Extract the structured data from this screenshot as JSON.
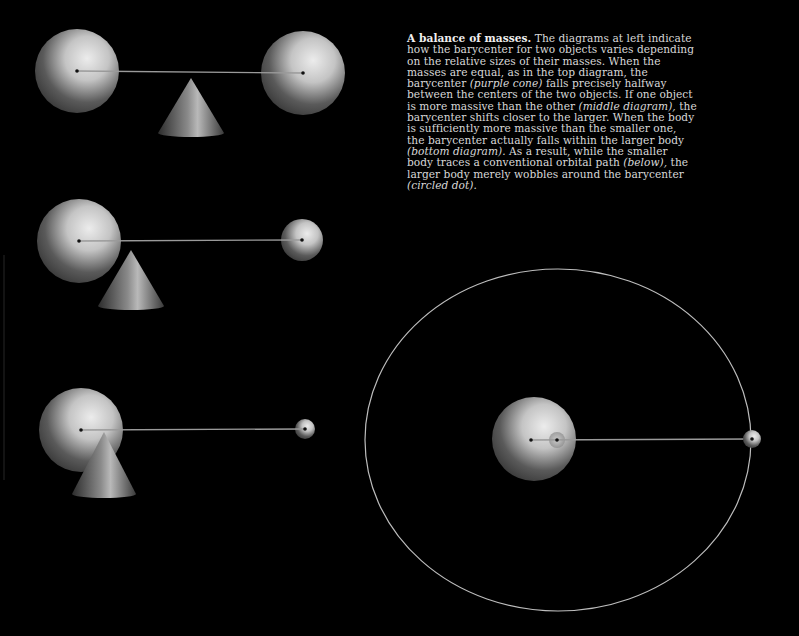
{
  "caption": {
    "title": "A balance of masses.",
    "segments": [
      {
        "text": " The diagrams at left indicate how the barycenter for two objects varies depending on the relative sizes of their masses. When the masses are equal, as in the top diagram, the barycenter ",
        "italic": false
      },
      {
        "text": "(purple cone)",
        "italic": true
      },
      {
        "text": " falls precisely halfway between the centers of the two objects. If one object is more massive than the other ",
        "italic": false
      },
      {
        "text": "(middle diagram),",
        "italic": true
      },
      {
        "text": " the barycenter shifts closer to the larger. When the body is sufficiently more massive than the smaller one, the barycenter actually falls within the larger body ",
        "italic": false
      },
      {
        "text": "(bottom diagram).",
        "italic": true
      },
      {
        "text": " As a result, while the smaller body traces a conventional orbital path ",
        "italic": false
      },
      {
        "text": "(below),",
        "italic": true
      },
      {
        "text": " the larger body merely wobbles around the barycenter ",
        "italic": false
      },
      {
        "text": "(circled dot).",
        "italic": true
      }
    ]
  },
  "colors": {
    "background": "#000000",
    "sphere_light": "#e6e6e6",
    "sphere_dark": "#2a2a2a",
    "rod": "#9a9a9a",
    "orbit": "#bdbdbd",
    "text": "#d8d8d8"
  },
  "diagrams": [
    {
      "name": "equal-masses",
      "large": {
        "cx": 77,
        "cy": 71,
        "r": 42
      },
      "small": {
        "cx": 303,
        "cy": 73,
        "r": 42
      },
      "cone": {
        "apex_x": 191,
        "apex_y": 78,
        "base_y": 133,
        "half_width": 33
      }
    },
    {
      "name": "unequal-masses",
      "large": {
        "cx": 79,
        "cy": 241,
        "r": 42
      },
      "small": {
        "cx": 302,
        "cy": 240,
        "r": 21
      },
      "cone": {
        "apex_x": 131,
        "apex_y": 250,
        "base_y": 306,
        "half_width": 33
      }
    },
    {
      "name": "barycenter-inside",
      "large": {
        "cx": 81,
        "cy": 430,
        "r": 42
      },
      "small": {
        "cx": 305,
        "cy": 429,
        "r": 10
      },
      "cone": {
        "apex_x": 104,
        "apex_y": 432,
        "base_y": 494,
        "half_width": 32
      }
    }
  ],
  "orbit_diagram": {
    "ellipse": {
      "cx": 558,
      "cy": 440,
      "rx": 193,
      "ry": 171
    },
    "large": {
      "cx": 534,
      "cy": 439,
      "r": 42
    },
    "barycenter": {
      "cx": 557,
      "cy": 440,
      "r": 8
    },
    "large_center": {
      "cx": 531,
      "cy": 440
    },
    "small": {
      "cx": 752,
      "cy": 439,
      "r": 9
    }
  }
}
